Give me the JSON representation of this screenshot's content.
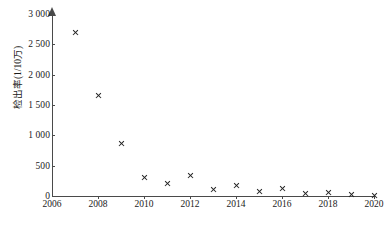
{
  "chart_data": {
    "type": "scatter",
    "title": "",
    "xlabel": "",
    "ylabel": "检出率(1/10万)",
    "x": [
      2007,
      2008,
      2009,
      2010,
      2011,
      2012,
      2013,
      2014,
      2015,
      2016,
      2017,
      2018,
      2019,
      2020
    ],
    "values": [
      2700,
      1650,
      870,
      310,
      205,
      330,
      110,
      165,
      75,
      120,
      45,
      50,
      25,
      10
    ],
    "xlim": [
      2006,
      2020
    ],
    "ylim": [
      0,
      3000
    ],
    "xticks": [
      2006,
      2008,
      2010,
      2012,
      2014,
      2016,
      2018,
      2020
    ],
    "xtick_labels": [
      "2006",
      "2008",
      "2010",
      "2012",
      "2014",
      "2016",
      "2018",
      "2020"
    ],
    "yticks": [
      0,
      500,
      1000,
      1500,
      2000,
      2500,
      3000
    ],
    "ytick_labels": [
      "0",
      "500",
      "1 000",
      "1 500",
      "2 000",
      "2 500",
      "3 000"
    ],
    "grid": false,
    "legend": null,
    "marker": "x",
    "marker_color": "#222222",
    "axis_color": "#4a4a4a"
  }
}
